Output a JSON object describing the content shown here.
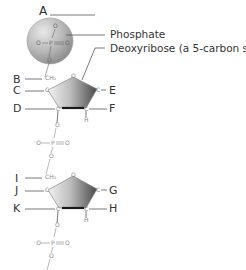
{
  "diagram": {
    "title_label": "A",
    "annotations": {
      "phosphate": "Phosphate",
      "deoxyribose": "Deoxyribose (a 5-carbon sugar)"
    },
    "letters": {
      "A": "A",
      "B": "B",
      "C": "C",
      "D": "D",
      "E": "E",
      "F": "F",
      "G": "G",
      "H": "H",
      "I": "I",
      "J": "J",
      "K": "K"
    },
    "atoms": {
      "oxygen": "O",
      "carbon": "C",
      "phosphorus": "P",
      "hydrogen": "H",
      "ch2": "CH₂",
      "o_minus": "⁻O"
    },
    "colors": {
      "line": "#555555",
      "atom_text": "#888888",
      "sphere_light": "#d8d8d8",
      "sphere_dark": "#8a8a8a",
      "pentagon_light": "#e6e6e6",
      "pentagon_dark": "#555555",
      "bold_bond": "#1a1a1a"
    }
  }
}
